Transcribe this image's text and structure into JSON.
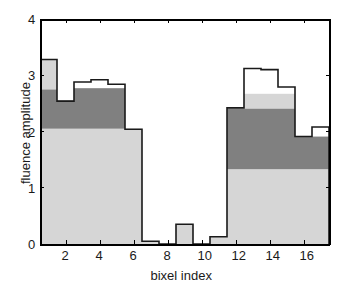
{
  "chart_data": {
    "type": "bar",
    "title": "",
    "subtitle": "",
    "xlabel": "bixel index",
    "ylabel": "fluence amplitude",
    "xlim": [
      0.5,
      17.5
    ],
    "ylim": [
      0,
      4
    ],
    "xticks": [
      2,
      4,
      6,
      8,
      10,
      12,
      14,
      16
    ],
    "xticklabels": [
      "2",
      "4",
      "6",
      "8",
      "10",
      "12",
      "14",
      "16"
    ],
    "yticks": [
      0,
      1,
      2,
      3,
      4
    ],
    "yticklabels": [
      "0",
      "1",
      "2",
      "3",
      "4"
    ],
    "grid": false,
    "legend": false,
    "legend_position": "none",
    "stacked": true,
    "categories": [
      1,
      2,
      3,
      4,
      5,
      6,
      7,
      8,
      9,
      10,
      11,
      12,
      13,
      14,
      15,
      16,
      17
    ],
    "series": [
      {
        "name": "lower-segment",
        "color": "#d6d6d6",
        "values": [
          2.05,
          2.05,
          2.05,
          2.05,
          2.05,
          2.05,
          0.05,
          0.0,
          0.35,
          0.0,
          0.13,
          1.33,
          1.33,
          1.33,
          1.33,
          1.33,
          1.33
        ]
      },
      {
        "name": "middle-segment",
        "color": "#808080",
        "values": [
          0.7,
          0.5,
          0.72,
          0.72,
          0.72,
          0.0,
          0.0,
          0.0,
          0.0,
          0.0,
          0.0,
          1.08,
          1.08,
          1.08,
          1.08,
          0.58,
          0.58
        ]
      },
      {
        "name": "upper-segment",
        "color": "#d6d6d6",
        "values": [
          0.53,
          0.0,
          0.0,
          0.0,
          0.0,
          0.0,
          0.0,
          0.0,
          0.0,
          0.0,
          0.0,
          0.02,
          0.26,
          0.26,
          0.26,
          0.0,
          0.0
        ]
      }
    ],
    "outline": {
      "name": "total-outline",
      "color": "#1a1a1a",
      "values": [
        3.28,
        2.54,
        2.88,
        2.92,
        2.84,
        2.04,
        0.05,
        0.0,
        0.35,
        0.0,
        0.13,
        2.42,
        3.12,
        3.1,
        2.79,
        1.91,
        2.08
      ]
    }
  },
  "colors": {
    "light_gray": "#d6d6d6",
    "dark_gray": "#808080",
    "outline": "#1a1a1a",
    "background": "#ffffff",
    "axis": "#000000"
  }
}
